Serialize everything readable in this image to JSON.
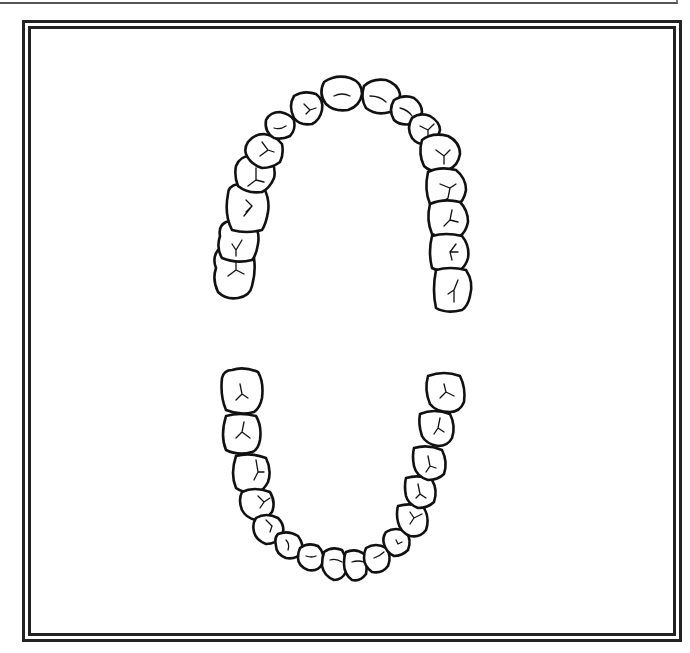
{
  "diagram": {
    "arches": [
      {
        "name": "upper",
        "tooth_count": 14,
        "shape": "inverted-U"
      },
      {
        "name": "lower",
        "tooth_count": 14,
        "shape": "U"
      }
    ],
    "frame": {
      "style": "double-line border",
      "color": "#222222"
    }
  }
}
